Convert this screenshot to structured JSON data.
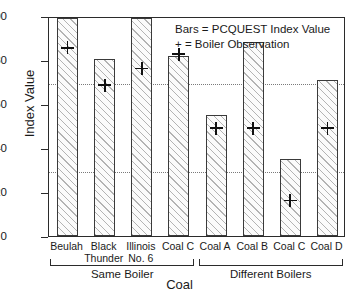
{
  "chart_data": {
    "type": "bar",
    "title": "",
    "xlabel": "Coal",
    "ylabel": "Index Value",
    "ylim": [
      0,
      100
    ],
    "yticks": [
      0,
      20,
      40,
      60,
      80,
      100
    ],
    "ytick_labels": [
      "0",
      "20",
      "40",
      "60",
      "80",
      "100"
    ],
    "grid": false,
    "reference_lines": [
      {
        "value": 70,
        "style": "dotted"
      },
      {
        "value": 30,
        "style": "dotted"
      }
    ],
    "categories": [
      "Beulah",
      "Black Thunder",
      "Illinois No. 6",
      "Coal C",
      "Coal A",
      "Coal B",
      "Coal C",
      "Coal D"
    ],
    "category_lines": [
      [
        "Beulah",
        ""
      ],
      [
        "Black",
        "Thunder"
      ],
      [
        "Illinois",
        "No. 6"
      ],
      [
        "Coal C",
        ""
      ],
      [
        "Coal A",
        ""
      ],
      [
        "Coal B",
        ""
      ],
      [
        "Coal C",
        ""
      ],
      [
        "Coal D",
        ""
      ]
    ],
    "series": [
      {
        "name": "PCQUEST Index Value",
        "type": "bar",
        "values": [
          99,
          80.5,
          99,
          82,
          55,
          88,
          35,
          71
        ]
      },
      {
        "name": "Boiler Observation",
        "type": "scatter",
        "marker": "+",
        "values": [
          86.5,
          69.5,
          77,
          83.5,
          50,
          50,
          17,
          50
        ]
      }
    ],
    "groups": [
      {
        "label": "Same Boiler",
        "from": 0,
        "to": 3
      },
      {
        "label": "Different Boilers",
        "from": 4,
        "to": 7
      }
    ]
  },
  "legend": {
    "position": "top-right-inside",
    "entries": [
      "Bars  =  PCQUEST Index Value",
      "+  = Boiler Observation"
    ]
  },
  "colors": {
    "axis": "#2b2b2b",
    "bar_edge": "#3a3a3a",
    "bar_hatch": "#787878",
    "marker": "#111111",
    "reference_line": "#7a7a7a",
    "background": "#ffffff"
  }
}
